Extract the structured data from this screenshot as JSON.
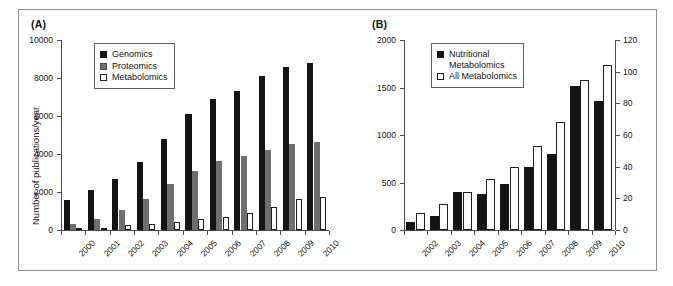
{
  "figure": {
    "panelA_label": "(A)",
    "panelB_label": "(B)"
  },
  "chart_data": [
    {
      "type": "bar",
      "panel": "(A)",
      "title": "",
      "xlabel": "",
      "ylabel": "Number of publications/year",
      "categories": [
        "2000",
        "2001",
        "2002",
        "2003",
        "2004",
        "2005",
        "2006",
        "2007",
        "2008",
        "2009",
        "2010"
      ],
      "series": [
        {
          "name": "Genomics",
          "color": "#141414",
          "values": [
            1600,
            2100,
            2700,
            3580,
            4800,
            6100,
            6900,
            7300,
            8120,
            8580,
            8780
          ]
        },
        {
          "name": "Proteomics",
          "color": "#6f6f6f",
          "values": [
            290,
            570,
            1050,
            1650,
            2430,
            3120,
            3610,
            3870,
            4230,
            4520,
            4630
          ]
        },
        {
          "name": "Metabolomics",
          "color": "#ffffff",
          "values": [
            110,
            120,
            250,
            320,
            420,
            570,
            700,
            880,
            1200,
            1610,
            1760
          ]
        }
      ],
      "ylim": [
        0,
        10000
      ],
      "yticks": [
        "0",
        "2000",
        "4000",
        "6000",
        "8000",
        "10000"
      ],
      "grid": false,
      "legend_position": "top-left"
    },
    {
      "type": "bar",
      "panel": "(B)",
      "title": "",
      "xlabel": "",
      "ylabel": "",
      "ylabel_right": "",
      "categories": [
        "2002",
        "2003",
        "2004",
        "2005",
        "2006",
        "2007",
        "2008",
        "2009",
        "2010"
      ],
      "series": [
        {
          "name": "Nutritional\nMetabolomics",
          "axis": "left",
          "color": "#141414",
          "values": [
            85,
            150,
            400,
            375,
            485,
            660,
            800,
            1520,
            1355
          ]
        },
        {
          "name": "All Metabolomics",
          "axis": "right",
          "color": "#ffffff",
          "values": [
            10.5,
            16.5,
            24,
            32.5,
            40,
            53,
            68.5,
            95,
            104
          ]
        }
      ],
      "ylim": [
        0,
        2000
      ],
      "yticks": [
        "0",
        "500",
        "1000",
        "1500",
        "2000"
      ],
      "ylim_right": [
        0,
        120
      ],
      "yticks_right": [
        "0",
        "20",
        "40",
        "60",
        "80",
        "100",
        "120"
      ],
      "grid": false,
      "legend_position": "top-left"
    }
  ],
  "panelA": {
    "label": "(A)",
    "y_axis_title": "Number of publications/year",
    "y_ticks": [
      "10000",
      "8000",
      "6000",
      "4000",
      "2000",
      "0"
    ],
    "x_ticks": [
      "2000",
      "2001",
      "2002",
      "2003",
      "2004",
      "2005",
      "2006",
      "2007",
      "2008",
      "2009",
      "2010"
    ],
    "legend": {
      "items": [
        {
          "label": "Genomics",
          "swatch": "black"
        },
        {
          "label": "Proteomics",
          "swatch": "gray"
        },
        {
          "label": "Metabolomics",
          "swatch": "white"
        }
      ]
    }
  },
  "panelB": {
    "label": "(B)",
    "y_ticks_left": [
      "2000",
      "1500",
      "1000",
      "500",
      "0"
    ],
    "y_ticks_right": [
      "120",
      "100",
      "80",
      "60",
      "40",
      "20",
      "0"
    ],
    "x_ticks": [
      "2002",
      "2003",
      "2004",
      "2005",
      "2006",
      "2007",
      "2008",
      "2009",
      "2010"
    ],
    "legend": {
      "items": [
        {
          "label": "Nutritional\nMetabolomics",
          "swatch": "black"
        },
        {
          "label": "All Metabolomics",
          "swatch": "white"
        }
      ]
    }
  }
}
